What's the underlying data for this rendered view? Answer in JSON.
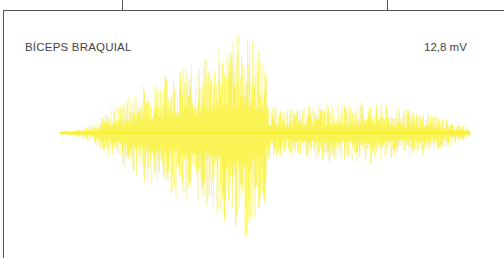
{
  "panel": {
    "muscle_label": "BÍCEPS BRAQUIAL",
    "scale_label": "12,8 mV",
    "trace_color": "#f7ef1a",
    "frame_color": "#555555"
  },
  "chart_data": {
    "type": "line",
    "title": "BÍCEPS BRAQUIAL",
    "annotations": [
      "12,8 mV"
    ],
    "xlabel": "",
    "ylabel": "",
    "grid": false,
    "legend": null,
    "layout": {
      "x_start_px": 60,
      "x_end_px": 470,
      "baseline_y_px": 133,
      "max_half_height_px": 108
    },
    "envelope": {
      "x": [
        0.0,
        0.05,
        0.1,
        0.15,
        0.2,
        0.25,
        0.3,
        0.35,
        0.4,
        0.45,
        0.5,
        0.51,
        0.55,
        0.6,
        0.65,
        0.7,
        0.75,
        0.8,
        0.85,
        0.9,
        0.95,
        1.0
      ],
      "amplitude": [
        0.02,
        0.04,
        0.15,
        0.3,
        0.45,
        0.55,
        0.62,
        0.68,
        0.85,
        1.0,
        0.7,
        0.25,
        0.22,
        0.25,
        0.28,
        0.26,
        0.3,
        0.25,
        0.22,
        0.2,
        0.12,
        0.05
      ]
    }
  }
}
